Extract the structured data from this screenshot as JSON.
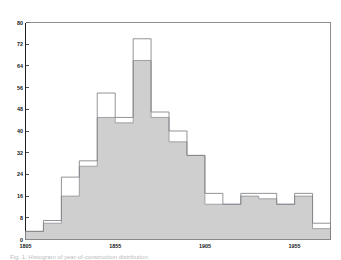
{
  "caption": "Fig. 1.  Histogram of year-of-construction distribution.",
  "chart_data": {
    "type": "bar",
    "title": "",
    "subtitle": "",
    "xlabel": "",
    "ylabel": "",
    "grid": false,
    "legend_position": "none",
    "bin_width": 10,
    "x_start": 1805,
    "x_end": 1975,
    "xlim": [
      1805,
      1975
    ],
    "ylim": [
      0,
      80
    ],
    "x_tick_interval": 10,
    "y_tick_interval": 8,
    "categories": [
      "1805-1815",
      "1815-1825",
      "1825-1835",
      "1835-1845",
      "1845-1855",
      "1855-1865",
      "1865-1875",
      "1875-1885",
      "1885-1895",
      "1895-1905",
      "1905-1915",
      "1915-1925",
      "1925-1935",
      "1935-1945",
      "1945-1955",
      "1955-1965",
      "1965-1975"
    ],
    "xtick_labels": [
      "1805",
      "1855",
      "1905",
      "1955"
    ],
    "xtick_values": [
      1805,
      1855,
      1905,
      1955
    ],
    "ytick_labels": [
      "0",
      "8",
      "16",
      "24",
      "32",
      "40",
      "48",
      "56",
      "64",
      "72",
      "80"
    ],
    "ytick_values": [
      0,
      8,
      16,
      24,
      32,
      40,
      48,
      56,
      64,
      72,
      80
    ],
    "series": [
      {
        "name": "filled",
        "style": "shaded",
        "color": "#cfcfcf",
        "edge_color": "#8d9094",
        "values": [
          3,
          6,
          16,
          27,
          45,
          43,
          66,
          45,
          36,
          31,
          13,
          13,
          16,
          15,
          13,
          16,
          4
        ]
      },
      {
        "name": "outline",
        "style": "open",
        "color": "#ffffff",
        "edge_color": "#7e8185",
        "values": [
          3,
          7,
          23,
          29,
          54,
          45,
          74,
          47,
          40,
          31,
          17,
          13,
          17,
          17,
          13,
          17,
          6
        ]
      }
    ]
  }
}
